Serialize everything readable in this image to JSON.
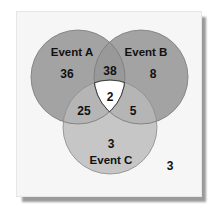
{
  "diagram": {
    "type": "venn",
    "sets": [
      {
        "id": "A",
        "label": "Event A"
      },
      {
        "id": "B",
        "label": "Event B"
      },
      {
        "id": "C",
        "label": "Event C"
      }
    ],
    "regions": {
      "A_only": "36",
      "B_only": "8",
      "C_only": "3",
      "A_and_B_only": "38",
      "A_and_C_only": "25",
      "B_and_C_only": "5",
      "A_and_B_and_C": "2",
      "outside": "3"
    },
    "colors": {
      "background": "#f6f6f6",
      "set_A": "#a3a3a3",
      "set_B": "#a3a3a3",
      "set_C": "#c6c6c6",
      "A_and_B": "#999999",
      "A_and_C": "#b5b5b5",
      "B_and_C": "#b5b5b5",
      "center": "#ffffff",
      "outline": "#7a7a7a",
      "shadow": "#9a9a9a"
    }
  }
}
